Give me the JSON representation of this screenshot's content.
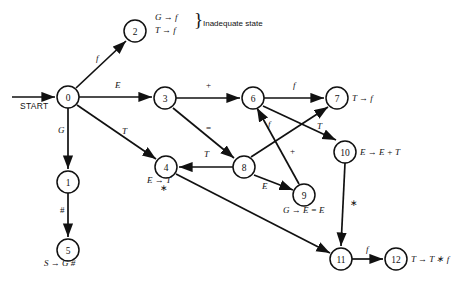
{
  "figure": {
    "type": "state-transition-diagram",
    "start_label": "START",
    "annotation": {
      "lines": [
        "G → f",
        "T → f"
      ],
      "brace": "}",
      "text": "Inadequate state"
    }
  },
  "nodes": [
    {
      "id": "0",
      "label": "0",
      "x": 68,
      "y": 97,
      "r": 11,
      "production": ""
    },
    {
      "id": "1",
      "label": "1",
      "x": 68,
      "y": 182,
      "r": 11,
      "production": ""
    },
    {
      "id": "2",
      "label": "2",
      "x": 135,
      "y": 31,
      "r": 11,
      "production": ""
    },
    {
      "id": "3",
      "label": "3",
      "x": 165,
      "y": 98,
      "r": 11,
      "production": ""
    },
    {
      "id": "4",
      "label": "4",
      "x": 166,
      "y": 167,
      "r": 11,
      "production": "E → T"
    },
    {
      "id": "5",
      "label": "5",
      "x": 68,
      "y": 250,
      "r": 11,
      "production": "S → G #"
    },
    {
      "id": "6",
      "label": "6",
      "x": 253,
      "y": 98,
      "r": 11,
      "production": ""
    },
    {
      "id": "7",
      "label": "7",
      "x": 337,
      "y": 98,
      "r": 11,
      "production": "T → f"
    },
    {
      "id": "8",
      "label": "8",
      "x": 244,
      "y": 167,
      "r": 11,
      "production": ""
    },
    {
      "id": "9",
      "label": "9",
      "x": 304,
      "y": 195,
      "r": 11,
      "production": "G → E = E"
    },
    {
      "id": "10",
      "label": "10",
      "x": 345,
      "y": 152,
      "r": 11,
      "production": "E → E + T"
    },
    {
      "id": "11",
      "label": "11",
      "x": 341,
      "y": 259,
      "r": 11,
      "production": ""
    },
    {
      "id": "12",
      "label": "12",
      "x": 396,
      "y": 259,
      "r": 11,
      "production": "T → T ∗ f"
    }
  ],
  "edges": [
    {
      "from": "START",
      "to": "0",
      "label": ""
    },
    {
      "from": "0",
      "to": "2",
      "label": "f"
    },
    {
      "from": "0",
      "to": "3",
      "label": "E"
    },
    {
      "from": "0",
      "to": "1",
      "label": "G"
    },
    {
      "from": "0",
      "to": "4",
      "label": "T"
    },
    {
      "from": "1",
      "to": "5",
      "label": "#"
    },
    {
      "from": "3",
      "to": "6",
      "label": "+"
    },
    {
      "from": "3",
      "to": "8",
      "label": "="
    },
    {
      "from": "6",
      "to": "7",
      "label": "f"
    },
    {
      "from": "6",
      "to": "10",
      "label": "T"
    },
    {
      "from": "8",
      "to": "4",
      "label": "T"
    },
    {
      "from": "8",
      "to": "7",
      "label": ""
    },
    {
      "from": "8",
      "to": "9",
      "label": "E"
    },
    {
      "from": "9",
      "to": "6",
      "label": "+"
    },
    {
      "from": "9",
      "to": "6b",
      "label": "f"
    },
    {
      "from": "4",
      "to": "11",
      "label": "∗"
    },
    {
      "from": "10",
      "to": "11",
      "label": "∗"
    },
    {
      "from": "11",
      "to": "12",
      "label": "f"
    }
  ],
  "edge_labels": [
    {
      "name": "edge-label-0-2",
      "text": "f",
      "x": 96,
      "y": 59
    },
    {
      "name": "edge-label-0-3",
      "text": "E",
      "x": 115,
      "y": 86
    },
    {
      "name": "edge-label-0-1",
      "text": "G",
      "x": 58,
      "y": 130
    },
    {
      "name": "edge-label-0-4",
      "text": "T",
      "x": 122,
      "y": 132
    },
    {
      "name": "edge-label-1-5",
      "text": "#",
      "x": 60,
      "y": 211
    },
    {
      "name": "edge-label-3-6",
      "text": "+",
      "x": 206,
      "y": 86
    },
    {
      "name": "edge-label-3-8",
      "text": "=",
      "x": 206,
      "y": 129
    },
    {
      "name": "edge-label-6-7",
      "text": "f",
      "x": 293,
      "y": 86
    },
    {
      "name": "edge-label-6-10",
      "text": "T",
      "x": 317,
      "y": 127
    },
    {
      "name": "edge-label-8-4",
      "text": "T",
      "x": 204,
      "y": 155
    },
    {
      "name": "edge-label-9-6",
      "text": "+",
      "x": 290,
      "y": 152
    },
    {
      "name": "edge-label-8-7",
      "text": "f",
      "x": 268,
      "y": 125
    },
    {
      "name": "edge-label-8-9",
      "text": "E",
      "x": 262,
      "y": 187
    },
    {
      "name": "edge-label-4-11",
      "text": "∗",
      "x": 160,
      "y": 188
    },
    {
      "name": "edge-label-10-11",
      "text": "∗",
      "x": 350,
      "y": 203
    },
    {
      "name": "edge-label-11-12",
      "text": "f",
      "x": 366,
      "y": 250
    }
  ],
  "node_productions": [
    {
      "name": "production-state-4",
      "text": "E → T",
      "x": 147,
      "y": 180
    },
    {
      "name": "production-state-5",
      "text": "S → G #",
      "x": 46,
      "y": 263
    },
    {
      "name": "production-state-7",
      "text": "T → f",
      "x": 352,
      "y": 93
    },
    {
      "name": "production-state-9",
      "text": "G → E = E",
      "x": 285,
      "y": 208
    },
    {
      "name": "production-state-10",
      "text": "E → E + T",
      "x": 360,
      "y": 147
    },
    {
      "name": "production-state-12",
      "text": "T → T ∗ f",
      "x": 411,
      "y": 254
    }
  ]
}
